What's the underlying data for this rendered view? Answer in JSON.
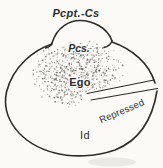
{
  "diagram": {
    "type": "freud-structural-model",
    "labels": {
      "pcpt_cs": "Pcpt.-Cs",
      "pcs": "Pcs.",
      "ego": "Ego",
      "repressed": "Repressed",
      "id": "Id"
    },
    "colors": {
      "ink": "#2e2c29",
      "background": "#fbfaf7",
      "stipple": "#5f5b55"
    },
    "stipple": {
      "cx": 78,
      "cy": 73,
      "rx": 48,
      "ry": 37,
      "count": 760,
      "seed": 7,
      "min_dot": 0.35,
      "max_dot": 0.9
    }
  }
}
